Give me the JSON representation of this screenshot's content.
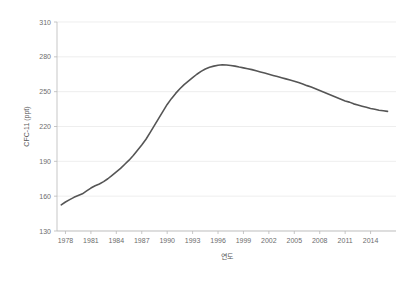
{
  "chart_data": {
    "type": "line",
    "title": "",
    "xlabel": "연도",
    "ylabel": "CFC-11 (ppt)",
    "xlim": [
      1977,
      2017
    ],
    "ylim": [
      130,
      310
    ],
    "grid": true,
    "legend": "none",
    "x_ticks": [
      1978,
      1981,
      1984,
      1987,
      1990,
      1993,
      1996,
      1999,
      2002,
      2005,
      2008,
      2011,
      2014
    ],
    "y_ticks": [
      130,
      160,
      190,
      220,
      250,
      280,
      310
    ],
    "series": [
      {
        "name": "CFC-11",
        "color": "#555555",
        "x": [
          1977.5,
          1978.0,
          1978.5,
          1979.0,
          1979.5,
          1980.0,
          1980.5,
          1981.0,
          1981.5,
          1982.0,
          1982.5,
          1983.0,
          1983.5,
          1984.0,
          1984.5,
          1985.0,
          1985.5,
          1986.0,
          1986.5,
          1987.0,
          1987.5,
          1988.0,
          1988.5,
          1989.0,
          1989.5,
          1990.0,
          1990.5,
          1991.0,
          1991.5,
          1992.0,
          1992.5,
          1993.0,
          1993.5,
          1994.0,
          1994.5,
          1995.0,
          1995.5,
          1996.0,
          1996.5,
          1997.0,
          1997.5,
          1998.0,
          1998.5,
          1999.0,
          1999.5,
          2000.0,
          2000.5,
          2001.0,
          2001.5,
          2002.0,
          2002.5,
          2003.0,
          2003.5,
          2004.0,
          2004.5,
          2005.0,
          2005.5,
          2006.0,
          2006.5,
          2007.0,
          2007.5,
          2008.0,
          2008.5,
          2009.0,
          2009.5,
          2010.0,
          2010.5,
          2011.0,
          2011.5,
          2012.0,
          2012.5,
          2013.0,
          2013.5,
          2014.0,
          2014.5,
          2015.0,
          2015.5,
          2016.0
        ],
        "y": [
          152.5,
          155.0,
          157.0,
          159.0,
          160.5,
          162.0,
          164.5,
          167.0,
          169.0,
          170.5,
          172.5,
          175.0,
          178.0,
          181.0,
          184.0,
          187.5,
          191.0,
          195.0,
          199.5,
          204.0,
          209.0,
          215.0,
          221.0,
          227.0,
          233.0,
          239.0,
          244.0,
          248.5,
          252.5,
          256.0,
          259.0,
          262.0,
          265.0,
          267.5,
          269.5,
          271.0,
          272.0,
          272.8,
          273.2,
          273.0,
          272.5,
          272.0,
          271.2,
          270.5,
          269.8,
          269.0,
          268.0,
          267.0,
          266.0,
          265.0,
          264.0,
          263.0,
          262.0,
          261.0,
          260.0,
          259.0,
          257.8,
          256.5,
          255.2,
          254.0,
          252.5,
          251.0,
          249.5,
          248.0,
          246.5,
          245.0,
          243.5,
          242.0,
          241.0,
          239.5,
          238.5,
          237.5,
          236.5,
          235.5,
          234.8,
          234.0,
          233.5,
          233.0
        ]
      }
    ]
  }
}
